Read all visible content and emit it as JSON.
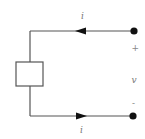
{
  "diagram": {
    "type": "two-terminal circuit element",
    "colors": {
      "wire": "#555555",
      "arrow": "#111111",
      "terminal": "#111111",
      "label": "#777777",
      "background": "#ffffff"
    },
    "labels": {
      "current_top": "i",
      "current_bottom": "i",
      "plus": "+",
      "voltage": "v",
      "minus": "-"
    },
    "element": {
      "shape": "rectangle",
      "label": ""
    },
    "terminals": [
      "top-terminal",
      "bottom-terminal"
    ],
    "current_direction": {
      "top": "left (into element)",
      "bottom": "right (out of element)"
    }
  }
}
